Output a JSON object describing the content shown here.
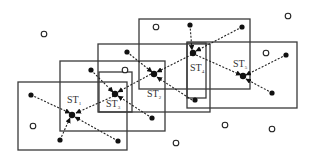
{
  "diagram": {
    "stations": [
      {
        "id": "ST1",
        "base": "ST",
        "sub": "1"
      },
      {
        "id": "ST2",
        "base": "ST",
        "sub": "2"
      },
      {
        "id": "ST3",
        "base": "ST",
        "sub": "3"
      },
      {
        "id": "ST4",
        "base": "ST",
        "sub": "4"
      },
      {
        "id": "ST5",
        "base": "ST",
        "sub": "5"
      }
    ],
    "legend": {
      "filled_dot": "active node",
      "hollow_dot": "idle node",
      "dashed_arrow": "transmission link"
    }
  }
}
